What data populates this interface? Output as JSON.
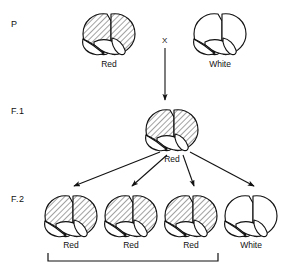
{
  "diagram": {
    "background_color": "#ffffff",
    "ink_color": "#111111",
    "hatch_fill_color": "#d8d8d8",
    "generations": [
      {
        "id": "P",
        "label": "P",
        "organisms": [
          {
            "phenotype_label": "Red",
            "fill": "hatched"
          },
          {
            "phenotype_label": "White",
            "fill": "white"
          }
        ],
        "cross_symbol": "X"
      },
      {
        "id": "F1",
        "label": "F.1",
        "organisms": [
          {
            "phenotype_label": "Red",
            "fill": "hatched"
          }
        ]
      },
      {
        "id": "F2",
        "label": "F.2",
        "organisms": [
          {
            "phenotype_label": "Red",
            "fill": "hatched"
          },
          {
            "phenotype_label": "Red",
            "fill": "hatched"
          },
          {
            "phenotype_label": "Red",
            "fill": "hatched"
          },
          {
            "phenotype_label": "White",
            "fill": "white"
          }
        ]
      }
    ],
    "bracket": {
      "spans_label": "",
      "covers": [
        "Red",
        "Red",
        "Red"
      ]
    },
    "arrows": {
      "cross_arrow_count": 1,
      "f1_to_f2_arrow_count": 4
    }
  }
}
